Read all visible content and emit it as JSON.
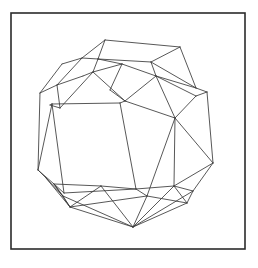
{
  "figure": {
    "kind": "line-drawing",
    "canvas": {
      "width": 258,
      "height": 268
    },
    "colors": {
      "background": "#ffffff",
      "frame_stroke": "#2b2b2b",
      "edge_stroke": "#3a3a3a",
      "face_fill": "#ffffff"
    },
    "stroke_widths": {
      "frame": 1.6,
      "edge": 0.85
    },
    "frame": {
      "x": 11,
      "y": 13,
      "width": 234,
      "height": 236
    },
    "vertices": {
      "t1": [
        105,
        40
      ],
      "t2": [
        180,
        47
      ],
      "t3": [
        196,
        88
      ],
      "t4": [
        151,
        62
      ],
      "t5": [
        82,
        58
      ],
      "t6": [
        57,
        85
      ],
      "t7": [
        62,
        64
      ],
      "m1": [
        98,
        59
      ],
      "m2": [
        93,
        72
      ],
      "m3": [
        125,
        101
      ],
      "m4": [
        122,
        64
      ],
      "m5": [
        156,
        76
      ],
      "m6": [
        175,
        118
      ],
      "m7": [
        60,
        108
      ],
      "m8": [
        83,
        76
      ],
      "m9": [
        110,
        90
      ],
      "l1": [
        40,
        93
      ],
      "l2": [
        38,
        170
      ],
      "l3": [
        50,
        105
      ],
      "l4": [
        46,
        178
      ],
      "r1": [
        207,
        92
      ],
      "r2": [
        213,
        163
      ],
      "r3": [
        196,
        96
      ],
      "b1": [
        63,
        196
      ],
      "b2": [
        70,
        207
      ],
      "b3": [
        133,
        227
      ],
      "b4": [
        187,
        203
      ],
      "b5": [
        193,
        191
      ],
      "b6": [
        101,
        186
      ],
      "b7": [
        147,
        196
      ],
      "c1": [
        54,
        184
      ],
      "c2": [
        174,
        186
      ],
      "q1": [
        52,
        104
      ],
      "q2": [
        120,
        103
      ],
      "q3": [
        136,
        189
      ],
      "q4": [
        64,
        193
      ]
    },
    "edges": [
      [
        "t1",
        "t2"
      ],
      [
        "t2",
        "t3"
      ],
      [
        "t3",
        "r1"
      ],
      [
        "r1",
        "r2"
      ],
      [
        "r2",
        "b5"
      ],
      [
        "b5",
        "b4"
      ],
      [
        "b4",
        "b3"
      ],
      [
        "b3",
        "b2"
      ],
      [
        "b2",
        "b1"
      ],
      [
        "b1",
        "l4"
      ],
      [
        "l4",
        "l2"
      ],
      [
        "l2",
        "l1"
      ],
      [
        "l1",
        "t7"
      ],
      [
        "t7",
        "t5"
      ],
      [
        "t5",
        "t1"
      ],
      [
        "t5",
        "t6"
      ],
      [
        "t6",
        "l1"
      ],
      [
        "t6",
        "m7"
      ],
      [
        "m7",
        "l3"
      ],
      [
        "l3",
        "q1"
      ],
      [
        "q1",
        "l2"
      ],
      [
        "t1",
        "m1"
      ],
      [
        "m1",
        "t5"
      ],
      [
        "m1",
        "m2"
      ],
      [
        "m2",
        "m8"
      ],
      [
        "m8",
        "t6"
      ],
      [
        "m2",
        "m7"
      ],
      [
        "m1",
        "m4"
      ],
      [
        "m4",
        "m2"
      ],
      [
        "m4",
        "m9"
      ],
      [
        "m9",
        "m3"
      ],
      [
        "m3",
        "m2"
      ],
      [
        "m1",
        "t4"
      ],
      [
        "t4",
        "t2"
      ],
      [
        "t4",
        "m5"
      ],
      [
        "m5",
        "m4"
      ],
      [
        "m5",
        "m3"
      ],
      [
        "m5",
        "m6"
      ],
      [
        "m6",
        "m3"
      ],
      [
        "t4",
        "t3"
      ],
      [
        "t3",
        "m5"
      ],
      [
        "m5",
        "r3"
      ],
      [
        "r3",
        "m6"
      ],
      [
        "r3",
        "r1"
      ],
      [
        "m6",
        "r2"
      ],
      [
        "q1",
        "q2"
      ],
      [
        "q2",
        "m3"
      ],
      [
        "q2",
        "q3"
      ],
      [
        "q3",
        "q4"
      ],
      [
        "q4",
        "q1"
      ],
      [
        "m6",
        "c2"
      ],
      [
        "c2",
        "q3"
      ],
      [
        "c2",
        "b5"
      ],
      [
        "c2",
        "b4"
      ],
      [
        "m6",
        "b7"
      ],
      [
        "b7",
        "q3"
      ],
      [
        "b7",
        "b4"
      ],
      [
        "b7",
        "b3"
      ],
      [
        "q3",
        "b6"
      ],
      [
        "b6",
        "c1"
      ],
      [
        "c1",
        "q4"
      ],
      [
        "c1",
        "b1"
      ],
      [
        "c1",
        "b2"
      ],
      [
        "b6",
        "b2"
      ],
      [
        "b6",
        "b3"
      ],
      [
        "b2",
        "b7"
      ],
      [
        "b1",
        "b3"
      ],
      [
        "b3",
        "c2"
      ],
      [
        "l2",
        "c1"
      ],
      [
        "l4",
        "b2"
      ],
      [
        "r2",
        "c2"
      ],
      [
        "b5",
        "b3"
      ]
    ]
  }
}
